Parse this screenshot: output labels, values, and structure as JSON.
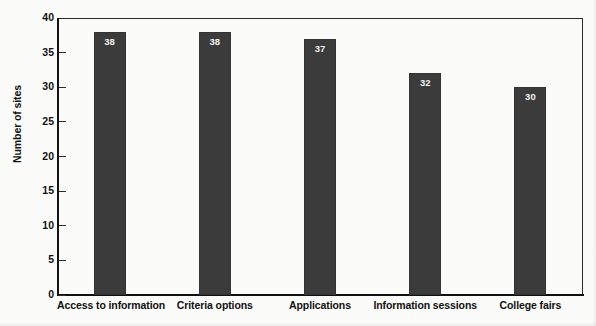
{
  "chart_data": {
    "type": "bar",
    "title": "",
    "xlabel": "",
    "ylabel": "Number of sites",
    "categories": [
      "Access to information",
      "Criteria options",
      "Applications",
      "Information sessions",
      "College fairs"
    ],
    "values": [
      38,
      38,
      37,
      32,
      30
    ],
    "value_labels": [
      "38",
      "38",
      "37",
      "32",
      "30"
    ],
    "ylim": [
      0,
      40
    ],
    "ytick_labels": [
      "0",
      "5",
      "10",
      "15",
      "20",
      "25",
      "30",
      "35",
      "40"
    ],
    "ytick_values": [
      0,
      5,
      10,
      15,
      20,
      25,
      30,
      35,
      40
    ],
    "grid": false,
    "legend": false,
    "legend_position": "none",
    "bar_color": "#3b3b3b",
    "value_label_color": "#f2f2f2",
    "axis_color": "#131313",
    "background_color": "#fbfbf9"
  }
}
